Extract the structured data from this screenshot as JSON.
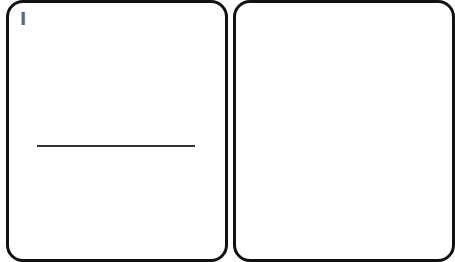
{
  "cards": [
    {
      "rank": "I",
      "answer_line": ""
    },
    {
      "rank": ""
    }
  ],
  "colors": {
    "card_border": "#111111",
    "card_fill": "#ffffff",
    "rank_text": "#666666",
    "line": "#333333"
  }
}
